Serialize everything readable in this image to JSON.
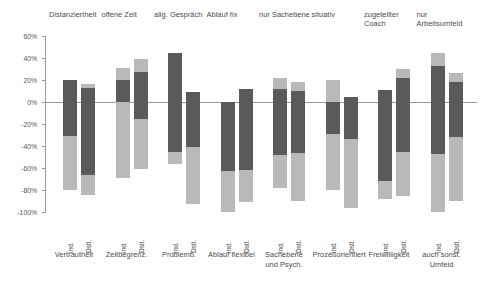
{
  "chart_data": {
    "type": "bar",
    "subtype": "stacked-diverging",
    "title": "",
    "xlabel": "",
    "ylabel": "",
    "ylim": [
      -100,
      60
    ],
    "ytick_values": [
      60,
      40,
      20,
      0,
      -20,
      -40,
      -60,
      -80,
      -100
    ],
    "ytick_labels": [
      "60%",
      "40%",
      "20%",
      "0%",
      "-20%",
      "-40%",
      "-60%",
      "-80%",
      "-100%"
    ],
    "grid": false,
    "legend_position": "none",
    "series_names": [
      "dunkelgrau",
      "hellgrau"
    ],
    "series_colors": [
      "#5a5a5a",
      "#b9b9b9"
    ],
    "bar_labels": [
      "ind.",
      "Dstl."
    ],
    "top_categories": [
      "Distanziertheit",
      "offene Zeit",
      "allg. Gespräch",
      "Ablauf fix",
      "nur Sachebene",
      "situativ",
      "zugeteilter Coach",
      "nur Arbeitsumfeld"
    ],
    "bottom_categories": [
      "Vertrautheit",
      "Zeitbegrenz.",
      "Problemb.",
      "Ablauf flexibel",
      "Sachebene und Psych.",
      "Prozeßorientiert",
      "Freiwilligkeit",
      "auch sonst. Umfeld"
    ],
    "groups": [
      {
        "top": "Distanziertheit",
        "bottom": "Vertrautheit",
        "bars": [
          {
            "label": "ind.",
            "pos_dark": 20,
            "pos_light": 0,
            "neg_dark": -31,
            "neg_light": -49
          },
          {
            "label": "Dstl.",
            "pos_dark": 13,
            "pos_light": 3,
            "neg_dark": -66,
            "neg_light": -19
          }
        ]
      },
      {
        "top": "offene Zeit",
        "bottom": "Zeitbegrenz.",
        "bars": [
          {
            "label": "ind.",
            "pos_dark": 20,
            "pos_light": 11,
            "neg_dark": 0,
            "neg_light": -69
          },
          {
            "label": "Dstl.",
            "pos_dark": 27,
            "pos_light": 12,
            "neg_dark": -15,
            "neg_light": -46
          }
        ]
      },
      {
        "top": "allg. Gespräch",
        "bottom": "Problemb.",
        "bars": [
          {
            "label": "ind.",
            "pos_dark": 45,
            "pos_light": 0,
            "neg_dark": -45,
            "neg_light": -11
          },
          {
            "label": "Dstl.",
            "pos_dark": 9,
            "pos_light": 0,
            "neg_dark": -41,
            "neg_light": -52
          }
        ]
      },
      {
        "top": "Ablauf fix",
        "bottom": "Ablauf flexibel",
        "bars": [
          {
            "label": "ind.",
            "pos_dark": 0,
            "pos_light": 0,
            "neg_dark": -63,
            "neg_light": -37
          },
          {
            "label": "Dstl.",
            "pos_dark": 12,
            "pos_light": 0,
            "neg_dark": -62,
            "neg_light": -29
          }
        ]
      },
      {
        "top": "nur Sachebene",
        "bottom": "Sachebene und Psych.",
        "bars": [
          {
            "label": "ind.",
            "pos_dark": 12,
            "pos_light": 10,
            "neg_dark": -48,
            "neg_light": -30
          },
          {
            "label": "Dstl.",
            "pos_dark": 10,
            "pos_light": 8,
            "neg_dark": -46,
            "neg_light": -44
          }
        ]
      },
      {
        "top": "situativ",
        "bottom": "Prozeßorientiert",
        "bars": [
          {
            "label": "ind.",
            "pos_dark": 0,
            "pos_light": 20,
            "neg_dark": -29,
            "neg_light": -51
          },
          {
            "label": "Dstl.",
            "pos_dark": 5,
            "pos_light": 0,
            "neg_dark": -34,
            "neg_light": -62
          }
        ]
      },
      {
        "top": "zugeteilter Coach",
        "bottom": "Freiwilligkeit",
        "bars": [
          {
            "label": "ind.",
            "pos_dark": 11,
            "pos_light": 0,
            "neg_dark": -72,
            "neg_light": -16
          },
          {
            "label": "Dstl.",
            "pos_dark": 22,
            "pos_light": 8,
            "neg_dark": -45,
            "neg_light": -40
          }
        ]
      },
      {
        "top": "nur Arbeitsumfeld",
        "bottom": "auch sonst. Umfeld",
        "bars": [
          {
            "label": "ind.",
            "pos_dark": 33,
            "pos_light": 12,
            "neg_dark": -47,
            "neg_light": -53
          },
          {
            "label": "Dstl.",
            "pos_dark": 18,
            "pos_light": 8,
            "neg_dark": -32,
            "neg_light": -58
          }
        ]
      }
    ]
  }
}
